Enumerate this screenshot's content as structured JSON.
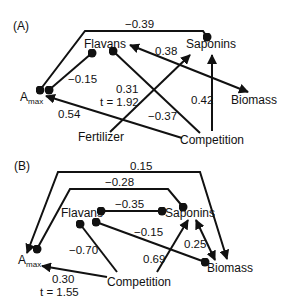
{
  "panel_a": {
    "label": "(A)",
    "nodes": {
      "amax": "A",
      "amax_sub": "max",
      "flavans": "Flavans",
      "saponins": "Saponins",
      "biomass": "Biomass",
      "fertilizer": "Fertilizer",
      "competition": "Competition"
    },
    "edges": [
      {
        "from": "Amax",
        "to": "Saponins",
        "type": "correlation",
        "coef": "−0.39"
      },
      {
        "from": "Amax",
        "to": "Flavans",
        "type": "correlation",
        "coef": "−0.15"
      },
      {
        "from": "Fertilizer",
        "to": "Saponins",
        "type": "path",
        "coef": "0.31",
        "t": "t = 1.92"
      },
      {
        "from": "Competition",
        "to": "Flavans",
        "type": "correlation",
        "coef": "−0.37"
      },
      {
        "from": "Competition",
        "to": "Saponins",
        "type": "path",
        "coef": "0.42"
      },
      {
        "from": "Biomass",
        "to": "Flavans",
        "type": "path",
        "coef": "0.38"
      },
      {
        "from": "Competition",
        "to": "Amax",
        "type": "path",
        "coef": "0.54"
      }
    ]
  },
  "panel_b": {
    "label": "(B)",
    "nodes": {
      "amax": "A",
      "amax_sub": "max",
      "flavans": "Flavans",
      "saponins": "Saponins",
      "biomass": "Biomass",
      "competition": "Competition"
    },
    "edges": [
      {
        "from": "Biomass",
        "to": "Amax",
        "type": "path",
        "coef": "0.15"
      },
      {
        "from": "Amax",
        "to": "Saponins",
        "type": "correlation",
        "coef": "−0.28"
      },
      {
        "from": "Flavans",
        "to": "Saponins",
        "type": "correlation",
        "coef": "−0.35"
      },
      {
        "from": "Flavans",
        "to": "Biomass",
        "type": "correlation",
        "coef": "−0.15"
      },
      {
        "from": "Competition",
        "to": "Flavans",
        "type": "correlation",
        "coef": "−0.70"
      },
      {
        "from": "Competition",
        "to": "Saponins",
        "type": "path",
        "coef": "0.69"
      },
      {
        "from": "Saponins",
        "to": "Biomass",
        "type": "bidirectional",
        "coef": "0.25"
      },
      {
        "from": "Competition",
        "to": "Amax",
        "type": "path",
        "coef": "0.30",
        "t": "t = 1.55"
      }
    ]
  }
}
